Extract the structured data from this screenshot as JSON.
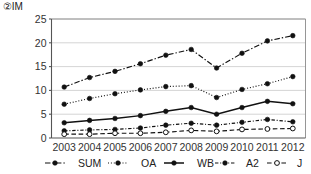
{
  "chart_data": {
    "type": "line",
    "title": "②IM",
    "xlabel": "",
    "ylabel": "",
    "x": [
      2003,
      2004,
      2005,
      2006,
      2007,
      2008,
      2009,
      2010,
      2011,
      2012
    ],
    "categories": [
      "2003",
      "2004",
      "2005",
      "2006",
      "2007",
      "2008",
      "2009",
      "2010",
      "2011",
      "2012"
    ],
    "ylim": [
      0,
      25
    ],
    "yticks": [
      0,
      5,
      10,
      15,
      20,
      25
    ],
    "ytick_labels": [
      "0",
      "5",
      "10",
      "15",
      "20",
      "25"
    ],
    "grid": true,
    "legend_position": "bottom",
    "series": [
      {
        "name": "SUM",
        "values": [
          10.7,
          12.7,
          14.0,
          15.6,
          17.4,
          18.6,
          14.7,
          17.8,
          20.4,
          21.5
        ],
        "line_style": "dash-dot",
        "marker": "filled-circle",
        "color": "#111111"
      },
      {
        "name": "OA",
        "values": [
          7.1,
          8.3,
          9.3,
          10.1,
          10.8,
          11.0,
          8.5,
          10.2,
          11.4,
          12.9
        ],
        "line_style": "dotted",
        "marker": "filled-circle",
        "color": "#111111"
      },
      {
        "name": "WB",
        "values": [
          3.2,
          3.7,
          4.1,
          4.7,
          5.6,
          6.4,
          5.0,
          6.4,
          7.7,
          7.2
        ],
        "line_style": "solid",
        "marker": "filled-circle",
        "color": "#111111"
      },
      {
        "name": "A2",
        "values": [
          1.5,
          1.7,
          1.8,
          2.1,
          2.7,
          3.1,
          2.7,
          3.3,
          3.9,
          3.4
        ],
        "line_style": "dash-dot-short",
        "marker": "filled-circle",
        "color": "#111111"
      },
      {
        "name": "J",
        "values": [
          0.8,
          0.8,
          1.0,
          1.0,
          1.2,
          1.6,
          1.4,
          1.8,
          1.9,
          2.0
        ],
        "line_style": "dashed",
        "marker": "open-circle",
        "color": "#111111"
      }
    ]
  }
}
